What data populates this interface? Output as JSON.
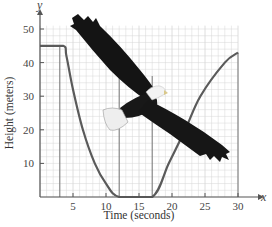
{
  "chart_data": {
    "type": "line",
    "title": "",
    "xlabel": "Time (seconds)",
    "ylabel": "Height (meters)",
    "x_axis_var": "x",
    "y_axis_var": "y",
    "xlim": [
      0,
      30
    ],
    "ylim": [
      0,
      50
    ],
    "xticks": [
      5,
      10,
      15,
      20,
      25,
      30
    ],
    "yticks": [
      10,
      20,
      30,
      40,
      50
    ],
    "grid": true,
    "legend": null,
    "series": [
      {
        "name": "Eagle height",
        "x": [
          0,
          3.5,
          4,
          5,
          6.5,
          8.3,
          10,
          12,
          17,
          19.5,
          22,
          24.3,
          28,
          30
        ],
        "y": [
          45,
          45,
          42,
          32,
          20,
          10,
          4,
          0,
          0,
          10,
          20,
          30,
          40,
          43
        ]
      }
    ],
    "vertical_guides": [
      3,
      12,
      17,
      30
    ],
    "annotations": [
      "illustration: bald eagle in flight overlaid on plot"
    ]
  },
  "colors": {
    "curve": "#5a5a5a",
    "grid": "#d6d6d6",
    "axis": "#555555",
    "guide": "#777777"
  }
}
